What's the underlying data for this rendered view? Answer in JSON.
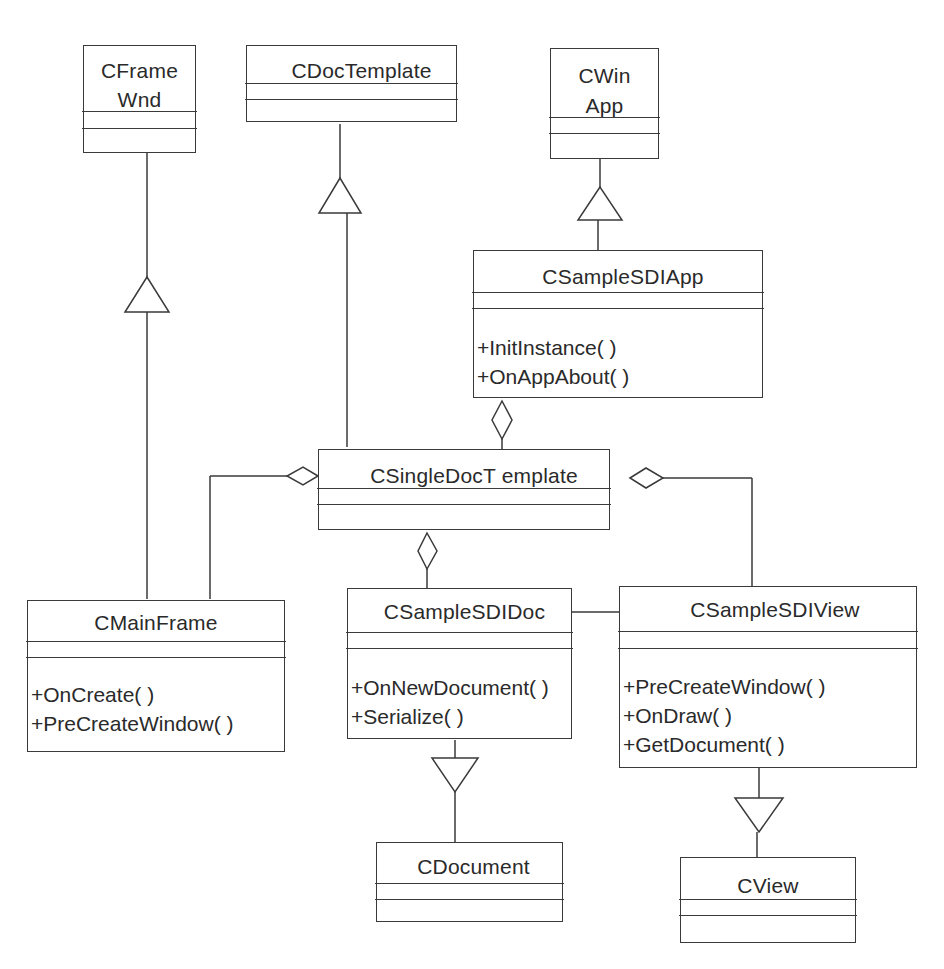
{
  "diagram": {
    "type": "UML class diagram",
    "line_color": "#3a3a3a",
    "classes": [
      {
        "id": "CFrameWnd",
        "name_lines": [
          "CFrame",
          "Wnd"
        ],
        "operations": []
      },
      {
        "id": "CDocTemplate",
        "name": "CDocTemplate",
        "operations": []
      },
      {
        "id": "CWinApp",
        "name_lines": [
          "CWin",
          "App"
        ],
        "operations": []
      },
      {
        "id": "CSampleSDIApp",
        "name": "CSampleSDIApp",
        "operations": [
          "+InitInstance( )",
          "+OnAppAbout( )"
        ]
      },
      {
        "id": "CSingleDocTemplate",
        "name": "CSingleDocT emplate",
        "operations": []
      },
      {
        "id": "CMainFrame",
        "name": "CMainFrame",
        "operations": [
          "+OnCreate( )",
          "+PreCreateWindow( )"
        ]
      },
      {
        "id": "CSampleSDIDoc",
        "name": "CSampleSDIDoc",
        "operations": [
          "+OnNewDocument( )",
          "+Serialize( )"
        ]
      },
      {
        "id": "CSampleSDIView",
        "name": "CSampleSDIView",
        "operations": [
          "+PreCreateWindow( )",
          "+OnDraw( )",
          "+GetDocument( )"
        ]
      },
      {
        "id": "CDocument",
        "name": "CDocument",
        "operations": []
      },
      {
        "id": "CView",
        "name": "CView",
        "operations": []
      }
    ],
    "relationships": [
      {
        "type": "generalization",
        "from": "CMainFrame",
        "to": "CFrameWnd"
      },
      {
        "type": "generalization",
        "from": "CSingleDocTemplate",
        "to": "CDocTemplate"
      },
      {
        "type": "generalization",
        "from": "CSampleSDIApp",
        "to": "CWinApp"
      },
      {
        "type": "generalization",
        "from": "CSampleSDIDoc",
        "to": "CDocument"
      },
      {
        "type": "generalization",
        "from": "CSampleSDIView",
        "to": "CView"
      },
      {
        "type": "aggregation",
        "whole": "CSampleSDIApp",
        "part": "CSingleDocTemplate"
      },
      {
        "type": "aggregation",
        "whole": "CSingleDocTemplate",
        "part": "CMainFrame"
      },
      {
        "type": "aggregation",
        "whole": "CSingleDocTemplate",
        "part": "CSampleSDIDoc"
      },
      {
        "type": "aggregation",
        "whole": "CSingleDocTemplate",
        "part": "CSampleSDIView"
      },
      {
        "type": "association",
        "a": "CSampleSDIDoc",
        "b": "CSampleSDIView"
      }
    ]
  }
}
